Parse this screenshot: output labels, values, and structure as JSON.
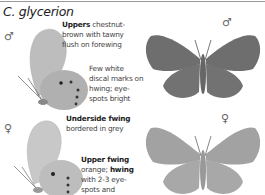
{
  "page": {
    "title": "C. glycerion",
    "male_symbol": "♂",
    "female_symbol": "♀"
  },
  "male": {
    "upperside_note": {
      "bold": "Uppers",
      "text": " chestnut-brown with tawny flush on forewing"
    },
    "underside_note": "Few white discal marks on hwing; eye-spots bright"
  },
  "female": {
    "underside_note": {
      "bold": "Underside fwing",
      "text": "bordered in grey"
    },
    "upperside_note": {
      "bold1": "Upper fwing",
      "text1": "orange; ",
      "bold2": "hwing",
      "text2": " with 2-3 eye-spots and orange marginal line"
    }
  },
  "colors": {
    "male_upper": "#6e6e6e",
    "female_upper": "#a0a0a0",
    "underside": "#b8b8b8",
    "rule": "#9a9a9a"
  }
}
